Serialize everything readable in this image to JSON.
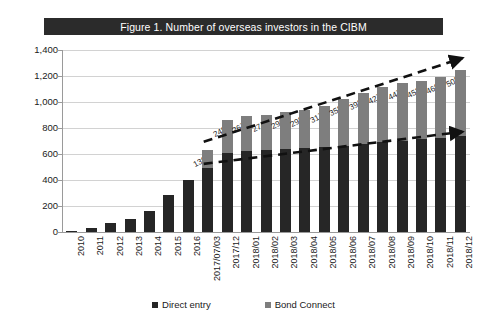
{
  "figure": {
    "title": "Figure 1.  Number of overseas investors in the CIBM",
    "title_bar_color": "#2b2b2b",
    "title_text_color": "#ffffff"
  },
  "legend": {
    "position": "bottom",
    "items": [
      {
        "label": "Direct entry",
        "color": "#262626",
        "marker": "square-marker-icon"
      },
      {
        "label": "Bond Connect",
        "color": "#7e7e7e",
        "marker": "square-marker-icon"
      }
    ]
  },
  "axes": {
    "y_ticks": [
      "0",
      "200",
      "400",
      "600",
      "800",
      "1,000",
      "1,200",
      "1,400"
    ],
    "y_min": 0,
    "y_max": 1400,
    "y_step": 200,
    "grid": true
  },
  "chart_data": {
    "type": "bar",
    "stacked": true,
    "title": "Figure 1.  Number of overseas investors in the CIBM",
    "xlabel": "",
    "ylabel": "",
    "ylim": [
      0,
      1400
    ],
    "ytick_labels": [
      "0",
      "200",
      "400",
      "600",
      "800",
      "1,000",
      "1,200",
      "1,400"
    ],
    "grid": true,
    "legend_position": "bottom",
    "categories": [
      "2010",
      "2011",
      "2012",
      "2013",
      "2014",
      "2015",
      "2016",
      "2017/07/03",
      "2017/12",
      "2018/01",
      "2018/02",
      "2018/03",
      "2018/04",
      "2018/05",
      "2018/06",
      "2018/07",
      "2018/08",
      "2018/09",
      "2018/10",
      "2018/11",
      "2018/12"
    ],
    "series": [
      {
        "name": "Direct entry",
        "color": "#262626",
        "values": [
          4,
          33,
          72,
          98,
          163,
          281,
          398,
          493,
          610,
          622,
          628,
          636,
          644,
          652,
          665,
          678,
          690,
          700,
          712,
          726,
          740
        ]
      },
      {
        "name": "Bond Connect",
        "color": "#7e7e7e",
        "values": [
          0,
          0,
          0,
          0,
          0,
          0,
          0,
          139,
          249,
          267,
          274,
          290,
          298,
          317,
          358,
          393,
          427,
          447,
          452,
          469,
          505
        ]
      }
    ],
    "data_labels": {
      "series": "Bond Connect",
      "values": [
        139,
        249,
        267,
        274,
        290,
        298,
        317,
        358,
        393,
        427,
        447,
        452,
        469,
        505
      ],
      "start_category": "2017/07/03"
    },
    "annotations": [
      {
        "name": "upper-trend-arrow",
        "type": "dashed-arrow",
        "description": "rising dashed arrow along stacked bar tops"
      },
      {
        "name": "lower-trend-arrow",
        "type": "dashed-arrow",
        "description": "flat dashed arrow along direct entry tops"
      }
    ]
  }
}
